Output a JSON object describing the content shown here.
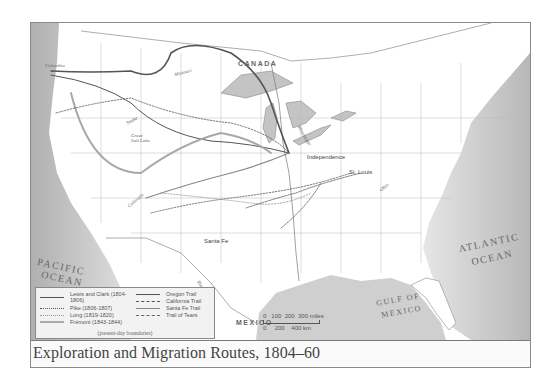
{
  "caption": {
    "title": "Exploration and Migration Routes, 1804–60"
  },
  "map_labels": {
    "canada": "CANADA",
    "mexico": "MEXICO",
    "pacific_ocean_line1": "PACIFIC",
    "pacific_ocean_line2": "OCEAN",
    "atlantic_ocean_line1": "ATLANTIC",
    "atlantic_ocean_line2": "OCEAN",
    "gulf_line1": "GULF OF",
    "gulf_line2": "MEXICO",
    "great_salt_lake": "Great Salt Lake",
    "cities": {
      "independence": "Independence",
      "st_louis": "St. Louis",
      "santa_fe": "Santa Fe"
    },
    "rivers": {
      "columbia": "Columbia",
      "missouri_upper": "Missouri",
      "snake": "Snake",
      "colorado": "Colorado",
      "mississippi": "Mississippi",
      "ohio": "Ohio",
      "rio_grande": "Rio Grande"
    }
  },
  "legend": {
    "items": [
      {
        "label": "Lewis and Clark (1804-1806)",
        "style": "solid-dark"
      },
      {
        "label": "Pike (1806-1807)",
        "style": "dotted"
      },
      {
        "label": "Long (1819-1820)",
        "style": "dotted-light"
      },
      {
        "label": "Frémont (1843-1844)",
        "style": "solid-light-thick"
      },
      {
        "label": "Oregon Trail",
        "style": "solid-dark-thin"
      },
      {
        "label": "California Trail",
        "style": "dashed-dark"
      },
      {
        "label": "Santa Fe Trail",
        "style": "solid-gray"
      },
      {
        "label": "Trail of Tears",
        "style": "double-dashed"
      }
    ],
    "note": "(present-day boundaries)"
  },
  "scale": {
    "miles_label": "0   100  200  300 miles",
    "km_label": "0     200    400 km"
  },
  "colors": {
    "water": "#c8c8c8",
    "land": "#ffffff",
    "route_dark": "#555555",
    "route_light": "#a8a8a8"
  }
}
